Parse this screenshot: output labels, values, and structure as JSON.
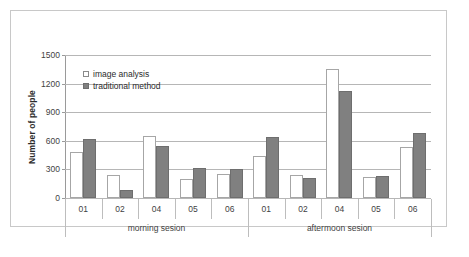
{
  "chart_data": {
    "type": "bar",
    "title": "",
    "xlabel": "",
    "ylabel": "Number of people",
    "ylim": [
      0,
      1500
    ],
    "yticks": [
      0,
      300,
      600,
      900,
      1200,
      1500
    ],
    "grid": true,
    "legend_position": "inside-top-left",
    "categories": [
      "01",
      "02",
      "04",
      "05",
      "06",
      "01",
      "02",
      "04",
      "05",
      "06"
    ],
    "groups": [
      {
        "label": "morning sesion",
        "categories": [
          "01",
          "02",
          "04",
          "05",
          "06"
        ]
      },
      {
        "label": "aftermoon sesion",
        "categories": [
          "01",
          "02",
          "04",
          "05",
          "06"
        ]
      }
    ],
    "series": [
      {
        "name": "image analysis",
        "color": "#ffffff",
        "values": [
          485,
          245,
          655,
          200,
          255,
          445,
          245,
          1350,
          220,
          540
        ]
      },
      {
        "name": "traditional method",
        "color": "#808080",
        "values": [
          620,
          85,
          545,
          310,
          305,
          645,
          205,
          1120,
          235,
          680
        ]
      }
    ]
  },
  "axis": {
    "y_title": "Number of people",
    "y_tick_labels": [
      "1500",
      "1200",
      "900",
      "600",
      "300",
      "0"
    ]
  },
  "legend": {
    "items": [
      {
        "label": "image analysis",
        "swatch": "white-square-outline-icon"
      },
      {
        "label": "traditional method",
        "swatch": "gray-filled-square-icon"
      }
    ]
  },
  "group_labels": {
    "left": "morning sesion",
    "right": "aftermoon sesion"
  },
  "category_labels": [
    "01",
    "02",
    "04",
    "05",
    "06",
    "01",
    "02",
    "04",
    "05",
    "06"
  ]
}
